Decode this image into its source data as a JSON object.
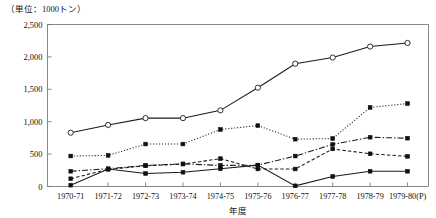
{
  "chart_data": {
    "type": "line",
    "title": "",
    "unit_label": "（単位：1000トン）",
    "xlabel": "年度",
    "ylabel": "",
    "ylim": [
      0,
      2500
    ],
    "yticks": [
      0,
      500,
      1000,
      1500,
      2000,
      2500
    ],
    "ytick_labels": [
      "0",
      "500",
      "1,000",
      "1,500",
      "2,000",
      "2,500"
    ],
    "grid": false,
    "legend": "none",
    "categories": [
      "1970-71",
      "1971-72",
      "1972-73",
      "1973-74",
      "1974-75",
      "1975-76",
      "1976-77",
      "1977-78",
      "1978-79",
      "1979-80(P)"
    ],
    "series": [
      {
        "name": "series-1",
        "style": "solid",
        "marker": "open-circle",
        "values": [
          830,
          950,
          1055,
          1055,
          1175,
          1525,
          1895,
          1990,
          2160,
          2215
        ]
      },
      {
        "name": "series-2",
        "style": "dotted",
        "marker": "filled-square",
        "values": [
          470,
          480,
          655,
          655,
          880,
          940,
          730,
          740,
          1220,
          1280
        ]
      },
      {
        "name": "series-3",
        "style": "dash-dot",
        "marker": "filled-square",
        "values": [
          235,
          275,
          325,
          350,
          325,
          330,
          470,
          650,
          760,
          745
        ]
      },
      {
        "name": "series-4",
        "style": "dashed",
        "marker": "filled-square",
        "values": [
          120,
          265,
          320,
          345,
          430,
          270,
          270,
          580,
          505,
          465
        ]
      },
      {
        "name": "series-5",
        "style": "solid",
        "marker": "filled-square",
        "values": [
          20,
          270,
          200,
          220,
          275,
          330,
          10,
          155,
          235,
          235
        ]
      }
    ]
  }
}
